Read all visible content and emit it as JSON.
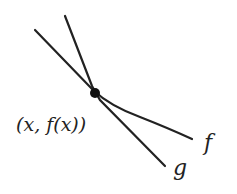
{
  "diagram": {
    "point_label": "(x, f(x))",
    "curve_f_label": "f",
    "curve_g_label": "g",
    "colors": {
      "stroke": "#222222",
      "background": "#ffffff"
    }
  }
}
